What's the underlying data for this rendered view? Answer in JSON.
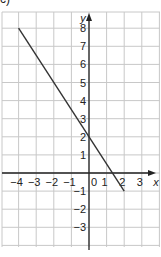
{
  "part_label": "c)",
  "chart_data": {
    "type": "line",
    "title": "",
    "xlabel": "x",
    "ylabel": "y",
    "xlim": [
      -5,
      3.5
    ],
    "ylim": [
      -4.3,
      8.8
    ],
    "grid": true,
    "x_ticks": [
      -4,
      -3,
      -2,
      -1,
      0,
      1,
      2,
      3
    ],
    "x_tick_labels": [
      "−4",
      "−3",
      "−2",
      "−1",
      "0",
      "1",
      "2",
      "3"
    ],
    "y_ticks": [
      -3,
      -2,
      -1,
      1,
      2,
      3,
      4,
      5,
      6,
      7,
      8
    ],
    "y_tick_labels": [
      "−3",
      "−2",
      "−1",
      "1",
      "2",
      "3",
      "4",
      "5",
      "6",
      "7",
      "8"
    ],
    "series": [
      {
        "name": "line",
        "x": [
          -4,
          2
        ],
        "y": [
          8,
          -1
        ],
        "color": "#333333"
      }
    ],
    "colors": {
      "grid": "#c8c8c8",
      "axis": "#222222",
      "line": "#333333",
      "text": "#222222"
    }
  }
}
